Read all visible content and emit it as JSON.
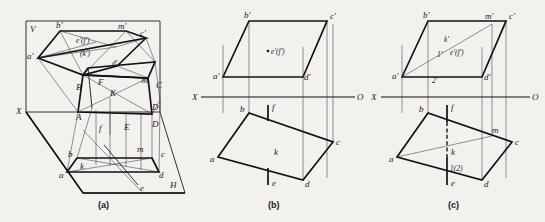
{
  "figure": {
    "background_color": "#f2f1ee",
    "line_color": "#1a1a1a",
    "captions": [
      {
        "key": "a",
        "text": "(a)"
      },
      {
        "key": "b",
        "text": "(b)"
      },
      {
        "key": "c",
        "text": "(c)"
      }
    ]
  },
  "panel_a": {
    "caption": "(a)",
    "plane_labels": [
      {
        "name": "v-plane-label",
        "text": "V"
      },
      {
        "name": "h-plane-label",
        "text": "H"
      },
      {
        "name": "x-axis-label",
        "text": "X"
      }
    ],
    "vertical_projection_labels": [
      {
        "name": "label-a-prime",
        "text": "a'"
      },
      {
        "name": "label-b-prime",
        "text": "b'"
      },
      {
        "name": "label-c-prime",
        "text": "c'"
      },
      {
        "name": "label-d-prime",
        "text": "d'"
      },
      {
        "name": "label-m-prime",
        "text": "m'"
      },
      {
        "name": "label-ef-prime",
        "text": "e'(f')"
      },
      {
        "name": "label-k-prime",
        "text": "(k')"
      }
    ],
    "space_labels": [
      {
        "name": "label-A",
        "text": "A"
      },
      {
        "name": "label-B",
        "text": "B"
      },
      {
        "name": "label-C",
        "text": "C"
      },
      {
        "name": "label-D-upper",
        "text": "D"
      },
      {
        "name": "label-D-lower",
        "text": "D"
      },
      {
        "name": "label-E",
        "text": "E"
      },
      {
        "name": "label-F",
        "text": "F"
      },
      {
        "name": "label-K",
        "text": "K"
      },
      {
        "name": "label-M",
        "text": "M"
      }
    ],
    "horizontal_projection_labels": [
      {
        "name": "label-a",
        "text": "a"
      },
      {
        "name": "label-b",
        "text": "b"
      },
      {
        "name": "label-c",
        "text": "c"
      },
      {
        "name": "label-d",
        "text": "d"
      },
      {
        "name": "label-e",
        "text": "e"
      },
      {
        "name": "label-f",
        "text": "f"
      },
      {
        "name": "label-k",
        "text": "k"
      },
      {
        "name": "label-m",
        "text": "m"
      }
    ]
  },
  "panel_b": {
    "caption": "(b)",
    "axis": {
      "left_label": "X",
      "right_label": "O"
    },
    "vertical_projection_labels": [
      {
        "name": "label-a-prime",
        "text": "a'"
      },
      {
        "name": "label-b-prime",
        "text": "b'"
      },
      {
        "name": "label-c-prime",
        "text": "c'"
      },
      {
        "name": "label-d-prime",
        "text": "d'"
      },
      {
        "name": "label-ef-prime",
        "text": "e'(f')"
      }
    ],
    "horizontal_projection_labels": [
      {
        "name": "label-a",
        "text": "a"
      },
      {
        "name": "label-b",
        "text": "b"
      },
      {
        "name": "label-c",
        "text": "c"
      },
      {
        "name": "label-d",
        "text": "d"
      },
      {
        "name": "label-e",
        "text": "e"
      },
      {
        "name": "label-f",
        "text": "f"
      },
      {
        "name": "label-k",
        "text": "k"
      }
    ]
  },
  "panel_c": {
    "caption": "(c)",
    "axis": {
      "left_label": "X",
      "right_label": "O"
    },
    "vertical_projection_labels": [
      {
        "name": "label-a-prime",
        "text": "a'"
      },
      {
        "name": "label-b-prime",
        "text": "b'"
      },
      {
        "name": "label-c-prime",
        "text": "c'"
      },
      {
        "name": "label-d-prime",
        "text": "d'"
      },
      {
        "name": "label-m-prime",
        "text": "m'"
      },
      {
        "name": "label-k-prime",
        "text": "k'"
      },
      {
        "name": "label-one-prime",
        "text": "1'"
      },
      {
        "name": "label-two-prime",
        "text": "2'"
      },
      {
        "name": "label-ef-prime",
        "text": "e'(f')"
      }
    ],
    "horizontal_projection_labels": [
      {
        "name": "label-a",
        "text": "a"
      },
      {
        "name": "label-b",
        "text": "b"
      },
      {
        "name": "label-c",
        "text": "c"
      },
      {
        "name": "label-d",
        "text": "d"
      },
      {
        "name": "label-e",
        "text": "e"
      },
      {
        "name": "label-f",
        "text": "f"
      },
      {
        "name": "label-k",
        "text": "k"
      },
      {
        "name": "label-m",
        "text": "m"
      },
      {
        "name": "label-one-two",
        "text": "1(2)"
      }
    ]
  }
}
